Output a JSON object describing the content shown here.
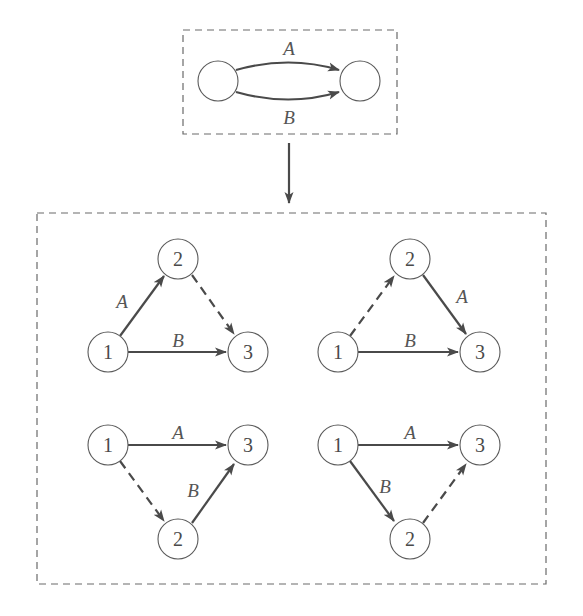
{
  "figure": {
    "top_box": {
      "nodes": [
        {
          "id": "L",
          "label": "",
          "x": 218,
          "y": 81
        },
        {
          "id": "R",
          "label": "",
          "x": 360,
          "y": 81
        }
      ],
      "edges": [
        {
          "from": "L",
          "to": "R",
          "label": "A",
          "style": "solid",
          "curve": "up"
        },
        {
          "from": "L",
          "to": "R",
          "label": "B",
          "style": "solid",
          "curve": "down"
        }
      ],
      "labels": {
        "A": "A",
        "B": "B"
      }
    },
    "arrow_down": {
      "description": "transformation arrow"
    },
    "bottom_box": {
      "diagrams": [
        {
          "position": "top-left",
          "nodes": [
            {
              "id": "1",
              "label": "1"
            },
            {
              "id": "2",
              "label": "2"
            },
            {
              "id": "3",
              "label": "3"
            }
          ],
          "edges": [
            {
              "from": "1",
              "to": "2",
              "label": "A",
              "style": "solid"
            },
            {
              "from": "2",
              "to": "3",
              "label": "",
              "style": "dashed"
            },
            {
              "from": "1",
              "to": "3",
              "label": "B",
              "style": "solid"
            }
          ]
        },
        {
          "position": "top-right",
          "nodes": [
            {
              "id": "1",
              "label": "1"
            },
            {
              "id": "2",
              "label": "2"
            },
            {
              "id": "3",
              "label": "3"
            }
          ],
          "edges": [
            {
              "from": "1",
              "to": "2",
              "label": "",
              "style": "dashed"
            },
            {
              "from": "2",
              "to": "3",
              "label": "A",
              "style": "solid"
            },
            {
              "from": "1",
              "to": "3",
              "label": "B",
              "style": "solid"
            }
          ]
        },
        {
          "position": "bottom-left",
          "nodes": [
            {
              "id": "1",
              "label": "1"
            },
            {
              "id": "2",
              "label": "2"
            },
            {
              "id": "3",
              "label": "3"
            }
          ],
          "edges": [
            {
              "from": "1",
              "to": "3",
              "label": "A",
              "style": "solid"
            },
            {
              "from": "1",
              "to": "2",
              "label": "",
              "style": "dashed"
            },
            {
              "from": "2",
              "to": "3",
              "label": "B",
              "style": "solid"
            }
          ]
        },
        {
          "position": "bottom-right",
          "nodes": [
            {
              "id": "1",
              "label": "1"
            },
            {
              "id": "2",
              "label": "2"
            },
            {
              "id": "3",
              "label": "3"
            }
          ],
          "edges": [
            {
              "from": "1",
              "to": "3",
              "label": "A",
              "style": "solid"
            },
            {
              "from": "1",
              "to": "2",
              "label": "B",
              "style": "solid"
            },
            {
              "from": "2",
              "to": "3",
              "label": "",
              "style": "dashed"
            }
          ]
        }
      ]
    },
    "text": {
      "A": "A",
      "B": "B",
      "n1": "1",
      "n2": "2",
      "n3": "3"
    },
    "colors": {
      "edge": "#4a4a4a",
      "node_stroke": "#5a5a5a",
      "box_stroke": "#6a6a6a",
      "background": "#ffffff"
    }
  }
}
